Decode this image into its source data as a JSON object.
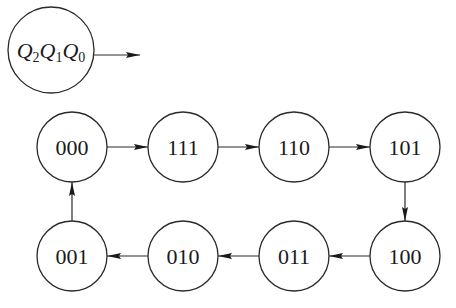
{
  "diagram": {
    "type": "state-transition",
    "legend": {
      "variables": [
        {
          "name": "Q",
          "sub": "2"
        },
        {
          "name": "Q",
          "sub": "1"
        },
        {
          "name": "Q",
          "sub": "0"
        }
      ]
    },
    "states": [
      {
        "id": "s000",
        "label": "000",
        "cx": 72,
        "cy": 147
      },
      {
        "id": "s111",
        "label": "111",
        "cx": 183,
        "cy": 147
      },
      {
        "id": "s110",
        "label": "110",
        "cx": 294,
        "cy": 147
      },
      {
        "id": "s101",
        "label": "101",
        "cx": 405,
        "cy": 147
      },
      {
        "id": "s100",
        "label": "100",
        "cx": 405,
        "cy": 256
      },
      {
        "id": "s011",
        "label": "011",
        "cx": 294,
        "cy": 256
      },
      {
        "id": "s010",
        "label": "010",
        "cx": 183,
        "cy": 256
      },
      {
        "id": "s001",
        "label": "001",
        "cx": 72,
        "cy": 256
      }
    ],
    "transitions": [
      {
        "from": "000",
        "to": "111"
      },
      {
        "from": "111",
        "to": "110"
      },
      {
        "from": "110",
        "to": "101"
      },
      {
        "from": "101",
        "to": "100"
      },
      {
        "from": "100",
        "to": "011"
      },
      {
        "from": "011",
        "to": "010"
      },
      {
        "from": "010",
        "to": "001"
      },
      {
        "from": "001",
        "to": "000"
      }
    ],
    "colors": {
      "stroke": "#2a2a2a",
      "text": "#1a1a1a",
      "background": "#ffffff"
    }
  }
}
